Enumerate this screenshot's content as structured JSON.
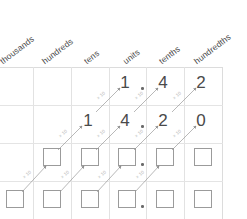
{
  "columns": [
    {
      "label": "thousands"
    },
    {
      "label": "hundreds"
    },
    {
      "label": "tens"
    },
    {
      "label": "units"
    },
    {
      "label": "tenths"
    },
    {
      "label": "hundredths"
    }
  ],
  "arrow_label": "× 10",
  "colors": {
    "digit": "#4a4a4a",
    "header": "#4b4b4b",
    "gridline": "#e2e2e2",
    "box_border": "#9b9b9b",
    "arrow": "#9a9a9a",
    "arrow_label": "#b9b9b9"
  },
  "rows": [
    {
      "name": "row-1",
      "cells": [
        {
          "column": "thousands",
          "type": "empty",
          "value": ""
        },
        {
          "column": "hundreds",
          "type": "empty",
          "value": ""
        },
        {
          "column": "tens",
          "type": "empty",
          "value": ""
        },
        {
          "column": "units",
          "type": "digit",
          "value": "1"
        },
        {
          "column": "tenths",
          "type": "digit",
          "value": "4"
        },
        {
          "column": "hundredths",
          "type": "digit",
          "value": "2"
        }
      ],
      "decimal_after": "units",
      "number": "1.42"
    },
    {
      "name": "row-2",
      "cells": [
        {
          "column": "thousands",
          "type": "empty",
          "value": ""
        },
        {
          "column": "hundreds",
          "type": "empty",
          "value": ""
        },
        {
          "column": "tens",
          "type": "digit",
          "value": "1"
        },
        {
          "column": "units",
          "type": "digit",
          "value": "4"
        },
        {
          "column": "tenths",
          "type": "digit",
          "value": "2"
        },
        {
          "column": "hundredths",
          "type": "digit",
          "value": "0"
        }
      ],
      "decimal_after": "units",
      "number": "14.20"
    },
    {
      "name": "row-3",
      "cells": [
        {
          "column": "thousands",
          "type": "empty",
          "value": ""
        },
        {
          "column": "hundreds",
          "type": "box",
          "value": ""
        },
        {
          "column": "tens",
          "type": "box",
          "value": ""
        },
        {
          "column": "units",
          "type": "box",
          "value": ""
        },
        {
          "column": "tenths",
          "type": "box",
          "value": ""
        },
        {
          "column": "hundredths",
          "type": "box",
          "value": ""
        }
      ],
      "decimal_after": "units",
      "number": ""
    },
    {
      "name": "row-4",
      "cells": [
        {
          "column": "thousands",
          "type": "box",
          "value": ""
        },
        {
          "column": "hundreds",
          "type": "box",
          "value": ""
        },
        {
          "column": "tens",
          "type": "box",
          "value": ""
        },
        {
          "column": "units",
          "type": "box",
          "value": ""
        },
        {
          "column": "tenths",
          "type": "box",
          "value": ""
        },
        {
          "column": "hundredths",
          "type": "box",
          "value": ""
        }
      ],
      "decimal_after": "units",
      "number": ""
    }
  ],
  "arrow_labels": [
    {
      "id": "a1",
      "text": "× 10"
    },
    {
      "id": "a2",
      "text": "× 10"
    },
    {
      "id": "a3",
      "text": "× 10"
    },
    {
      "id": "a4",
      "text": "× 10"
    },
    {
      "id": "a5",
      "text": "× 10"
    },
    {
      "id": "a6",
      "text": "× 10"
    },
    {
      "id": "a7",
      "text": "× 10"
    },
    {
      "id": "a8",
      "text": "× 10"
    },
    {
      "id": "a9",
      "text": "× 10"
    },
    {
      "id": "a10",
      "text": "× 10"
    },
    {
      "id": "a11",
      "text": "× 10"
    },
    {
      "id": "a12",
      "text": "× 10"
    },
    {
      "id": "a13",
      "text": "× 10"
    },
    {
      "id": "a14",
      "text": "× 10"
    }
  ]
}
